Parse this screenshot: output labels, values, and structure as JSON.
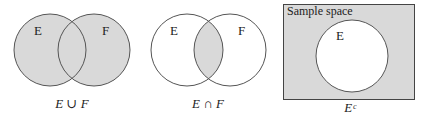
{
  "colors": {
    "shade": "#d9d9d9",
    "stroke": "#555555",
    "background": "#ffffff"
  },
  "panels": [
    {
      "set_labels": [
        "E",
        "F"
      ],
      "caption": "E ∪ F",
      "shaded": "union"
    },
    {
      "set_labels": [
        "E",
        "F"
      ],
      "caption": "E ∩ F",
      "shaded": "intersection"
    },
    {
      "box_label": "Sample space",
      "set_labels": [
        "E"
      ],
      "caption": "Eᶜ",
      "shaded": "complement"
    }
  ]
}
